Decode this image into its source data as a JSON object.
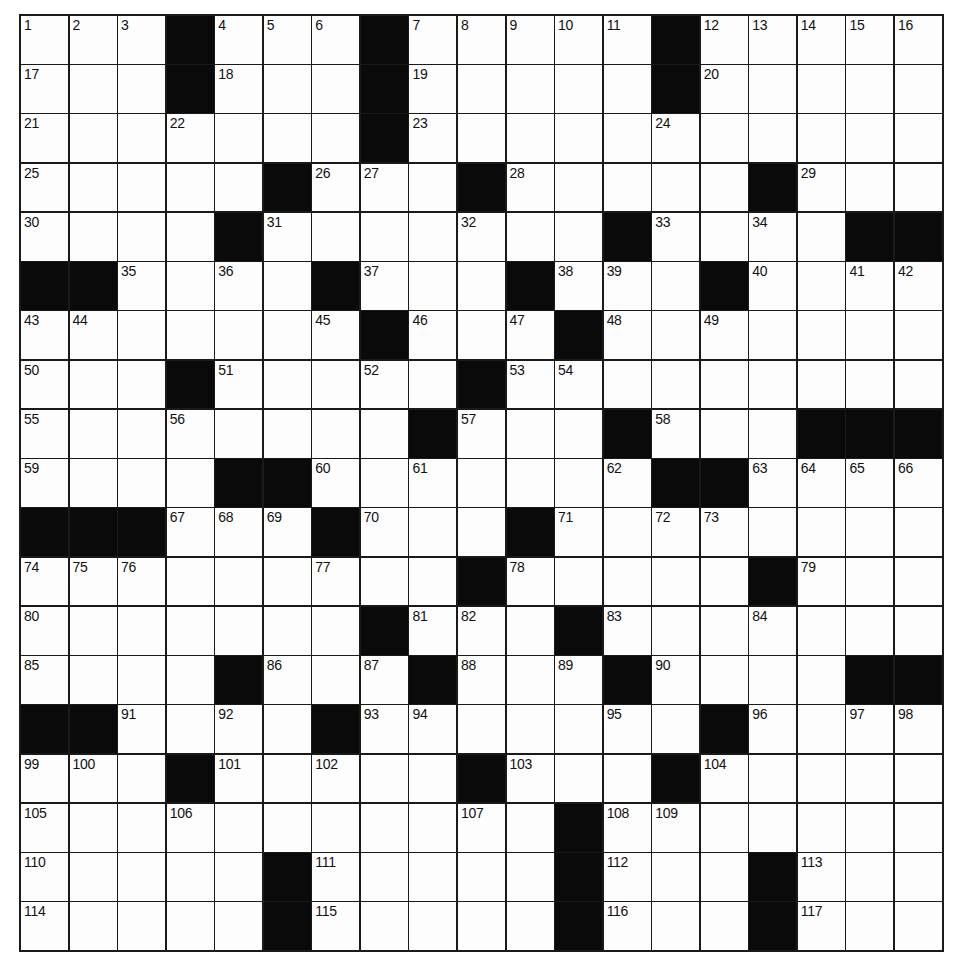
{
  "puzzle": {
    "rows": 19,
    "cols": 19,
    "colors": {
      "block": "#0a0a0a",
      "cell": "#fdfdfd",
      "line": "#1a1a1a"
    },
    "grid": [
      [
        "1",
        "2",
        "3",
        "#",
        "4",
        "5",
        "6",
        "#",
        "7",
        "8",
        "9",
        "10",
        "11",
        "#",
        "12",
        "13",
        "14",
        "15",
        "16"
      ],
      [
        "17",
        ".",
        ".",
        "#",
        "18",
        ".",
        ".",
        "#",
        "19",
        ".",
        ".",
        ".",
        ".",
        "#",
        "20",
        ".",
        ".",
        ".",
        "."
      ],
      [
        "21",
        ".",
        ".",
        "22",
        ".",
        ".",
        ".",
        "#",
        "23",
        ".",
        ".",
        ".",
        ".",
        "24",
        ".",
        ".",
        ".",
        ".",
        "."
      ],
      [
        "25",
        ".",
        ".",
        ".",
        ".",
        "#",
        "26",
        "27",
        ".",
        "#",
        "28",
        ".",
        ".",
        ".",
        ".",
        "#",
        "29",
        ".",
        "."
      ],
      [
        "30",
        ".",
        ".",
        ".",
        "#",
        "31",
        ".",
        ".",
        ".",
        "32",
        ".",
        ".",
        "#",
        "33",
        ".",
        "34",
        ".",
        "#",
        "#"
      ],
      [
        "#",
        "#",
        "35",
        ".",
        "36",
        ".",
        "#",
        "37",
        ".",
        ".",
        "#",
        "38",
        "39",
        ".",
        "#",
        "40",
        ".",
        "41",
        "42"
      ],
      [
        "43",
        "44",
        ".",
        ".",
        ".",
        ".",
        "45",
        "#",
        "46",
        ".",
        "47",
        "#",
        "48",
        ".",
        "49",
        ".",
        ".",
        ".",
        "."
      ],
      [
        "50",
        ".",
        ".",
        "#",
        "51",
        ".",
        ".",
        "52",
        ".",
        "#",
        "53",
        "54",
        ".",
        ".",
        ".",
        ".",
        ".",
        ".",
        "."
      ],
      [
        "55",
        ".",
        ".",
        "56",
        ".",
        ".",
        ".",
        ".",
        "#",
        "57",
        ".",
        ".",
        "#",
        "58",
        ".",
        ".",
        "#",
        "#",
        "#"
      ],
      [
        "59",
        ".",
        ".",
        ".",
        "#",
        "#",
        "60",
        ".",
        "61",
        ".",
        ".",
        ".",
        "62",
        "#",
        "#",
        "63",
        "64",
        "65",
        "66"
      ],
      [
        "#",
        "#",
        "#",
        "67",
        "68",
        "69",
        "#",
        "70",
        ".",
        ".",
        "#",
        "71",
        ".",
        "72",
        "73",
        ".",
        ".",
        ".",
        "."
      ],
      [
        "74",
        "75",
        "76",
        ".",
        ".",
        ".",
        "77",
        ".",
        ".",
        "#",
        "78",
        ".",
        ".",
        ".",
        ".",
        "#",
        "79",
        ".",
        "."
      ],
      [
        "80",
        ".",
        ".",
        ".",
        ".",
        ".",
        ".",
        "#",
        "81",
        "82",
        ".",
        "#",
        "83",
        ".",
        ".",
        "84",
        ".",
        ".",
        "."
      ],
      [
        "85",
        ".",
        ".",
        ".",
        "#",
        "86",
        ".",
        "87",
        "#",
        "88",
        ".",
        "89",
        "#",
        "90",
        ".",
        ".",
        ".",
        "#",
        "#"
      ],
      [
        "#",
        "#",
        "91",
        ".",
        "92",
        ".",
        "#",
        "93",
        "94",
        ".",
        ".",
        ".",
        "95",
        ".",
        "#",
        "96",
        ".",
        "97",
        "98"
      ],
      [
        "99",
        "100",
        ".",
        "#",
        "101",
        ".",
        "102",
        ".",
        ".",
        "#",
        "103",
        ".",
        ".",
        "#",
        "104",
        ".",
        ".",
        ".",
        "."
      ],
      [
        "105",
        ".",
        ".",
        "106",
        ".",
        ".",
        ".",
        ".",
        ".",
        "107",
        ".",
        "#",
        "108",
        "109",
        ".",
        ".",
        ".",
        ".",
        "."
      ],
      [
        "110",
        ".",
        ".",
        ".",
        ".",
        "#",
        "111",
        ".",
        ".",
        ".",
        ".",
        "#",
        "112",
        ".",
        ".",
        "#",
        "113",
        ".",
        "."
      ],
      [
        "114",
        ".",
        ".",
        ".",
        ".",
        "#",
        "115",
        ".",
        ".",
        ".",
        ".",
        "#",
        "116",
        ".",
        ".",
        "#",
        "117",
        ".",
        "."
      ]
    ]
  }
}
